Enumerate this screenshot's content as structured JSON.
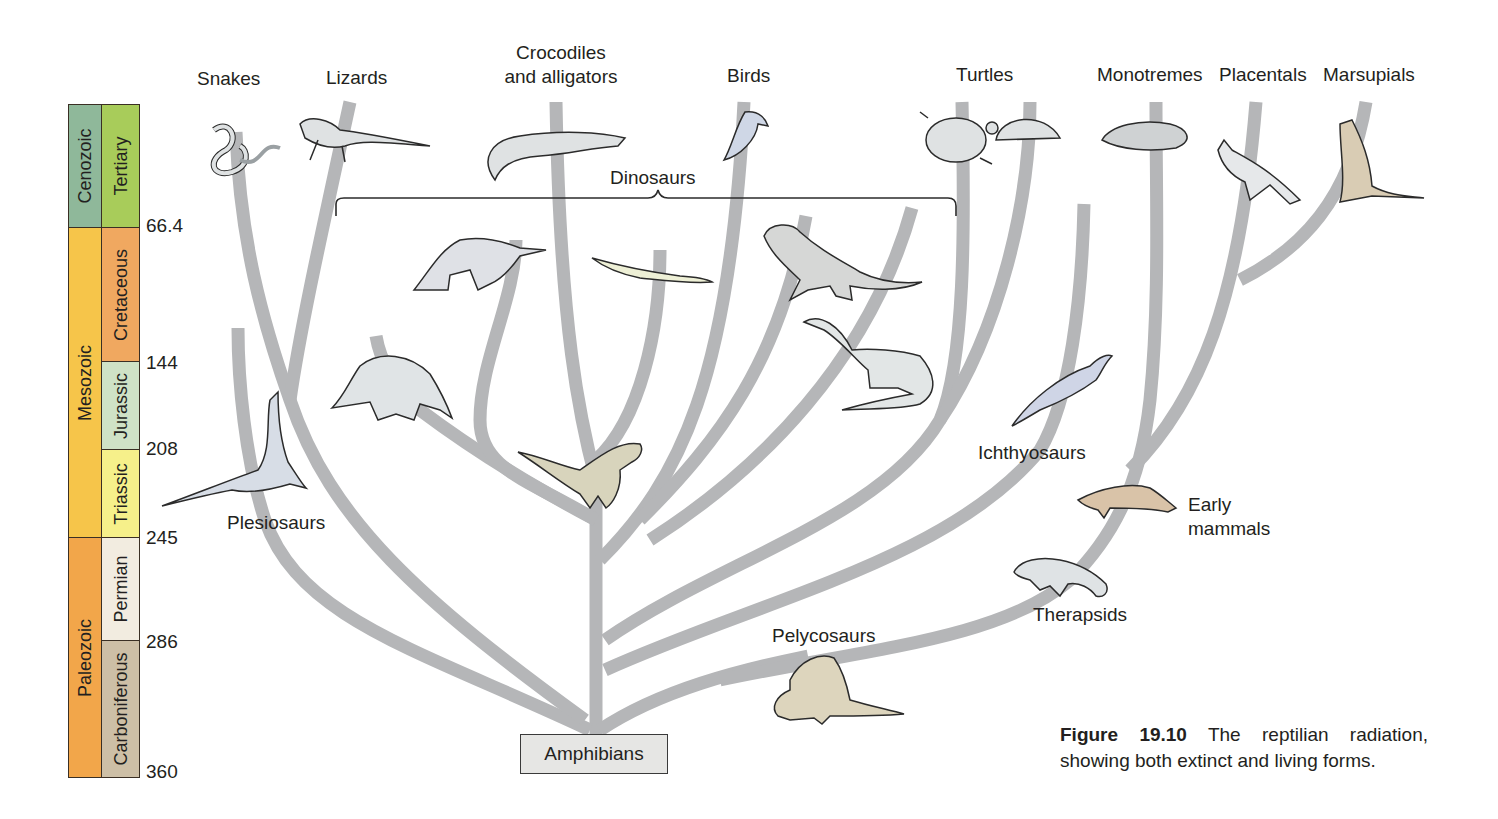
{
  "figure": {
    "number": "Figure 19.10",
    "caption": "The reptilian radiation, showing both extinct and living forms."
  },
  "timescale": {
    "eras": [
      {
        "name": "Cenozoic",
        "color": "#8fb89a"
      },
      {
        "name": "Mesozoic",
        "color": "#f6c54a"
      },
      {
        "name": "Paleozoic",
        "color": "#f2a64a"
      }
    ],
    "periods": [
      {
        "name": "Tertiary",
        "color": "#a8cc5a"
      },
      {
        "name": "Cretaceous",
        "color": "#f0a860"
      },
      {
        "name": "Jurassic",
        "color": "#cfe2c6"
      },
      {
        "name": "Triassic",
        "color": "#f6f08a"
      },
      {
        "name": "Permian",
        "color": "#f2ece0"
      },
      {
        "name": "Carboniferous",
        "color": "#cdbfa6"
      }
    ],
    "ticks": [
      "66.4",
      "144",
      "208",
      "245",
      "286",
      "360"
    ]
  },
  "root": {
    "label": "Amphibians"
  },
  "group_labels": {
    "dinosaurs": "Dinosaurs"
  },
  "top_labels": {
    "snakes": "Snakes",
    "lizards": "Lizards",
    "crocodiles_line1": "Crocodiles",
    "crocodiles_line2": "and alligators",
    "birds": "Birds",
    "turtles": "Turtles",
    "monotremes": "Monotremes",
    "placentals": "Placentals",
    "marsupials": "Marsupials"
  },
  "side_labels": {
    "plesiosaurs": "Plesiosaurs",
    "ichthyosaurs": "Ichthyosaurs",
    "early_mammals_line1": "Early",
    "early_mammals_line2": "mammals",
    "therapsids": "Therapsids",
    "pelycosaurs": "Pelycosaurs"
  },
  "colors": {
    "branch": "#b5b6b8",
    "animal_fill_gray": "#dfe2e3",
    "animal_fill_tan": "#d9ccb4",
    "animal_fill_blue": "#cfd7e6",
    "outline": "#2b2b2b"
  }
}
